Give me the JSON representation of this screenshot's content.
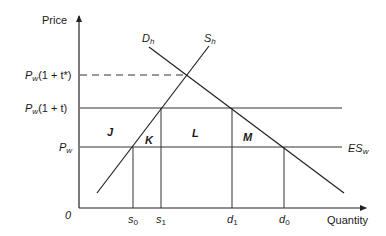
{
  "diagram": {
    "axes": {
      "y_label": "Price",
      "x_label": "Quantity",
      "origin_label": "0"
    },
    "curves": {
      "demand": {
        "base": "D",
        "sub": "h"
      },
      "supply": {
        "base": "S",
        "sub": "h"
      },
      "export_supply": {
        "base": "ES",
        "sub": "w"
      }
    },
    "price_levels": {
      "pw_t_star": {
        "base": "P",
        "sub": "w",
        "rest": "(1 + t*)"
      },
      "pw_t": {
        "base": "P",
        "sub": "w",
        "rest": "(1 + t)"
      },
      "pw": {
        "base": "P",
        "sub": "w"
      }
    },
    "quantities": {
      "s0": {
        "base": "s",
        "sub": "0"
      },
      "s1": {
        "base": "s",
        "sub": "1"
      },
      "d1": {
        "base": "d",
        "sub": "1"
      },
      "d0": {
        "base": "d",
        "sub": "0"
      }
    },
    "areas": {
      "J": "J",
      "K": "K",
      "L": "L",
      "M": "M"
    }
  }
}
